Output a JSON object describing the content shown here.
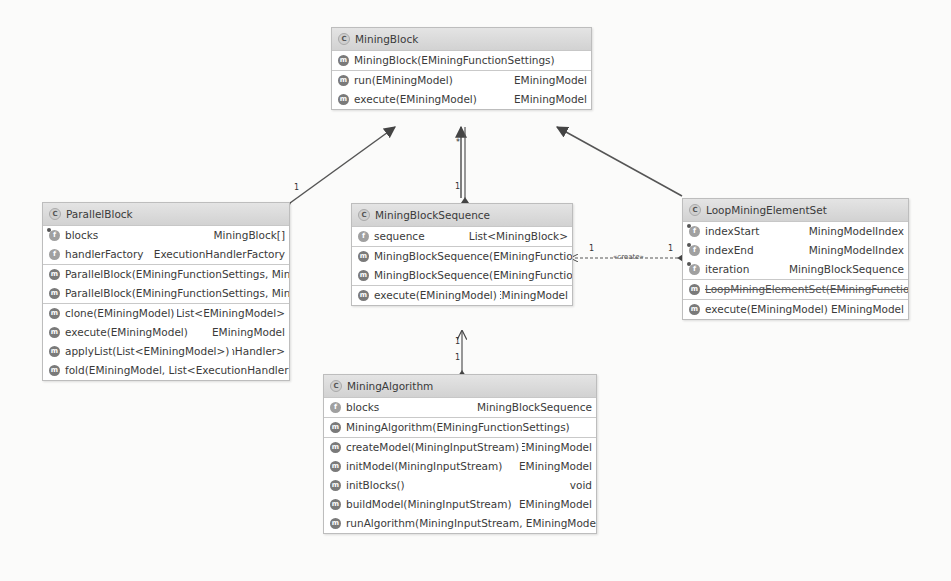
{
  "classes": {
    "mining_block": {
      "name": "MiningBlock",
      "icon": "class-icon",
      "constructors": [
        {
          "name": "MiningBlock(EMiningFunctionSettings)",
          "type": ""
        }
      ],
      "methods": [
        {
          "name": "run(EMiningModel)",
          "type": "EMiningModel"
        },
        {
          "name": "execute(EMiningModel)",
          "type": "EMiningModel"
        }
      ]
    },
    "parallel_block": {
      "name": "ParallelBlock",
      "icon": "class-icon",
      "fields": [
        {
          "name": "blocks",
          "type": "MiningBlock[]"
        },
        {
          "name": "handlerFactory",
          "type": "ExecutionHandlerFactory"
        }
      ],
      "constructors": [
        {
          "name": "ParallelBlock(EMiningFunctionSettings, MiningBl",
          "type": ""
        },
        {
          "name": "ParallelBlock(EMiningFunctionSettings, MiningBl",
          "type": ""
        }
      ],
      "methods": [
        {
          "name": "clone(EMiningModel)",
          "type": "List<EMiningModel>"
        },
        {
          "name": "execute(EMiningModel)",
          "type": "EMiningModel"
        },
        {
          "name": "applyList(List<EMiningModel>)",
          "type": "tionHandler>"
        },
        {
          "name": "fold(EMiningModel, List<ExecutionHandler>)",
          "type": ""
        }
      ]
    },
    "mining_block_sequence": {
      "name": "MiningBlockSequence",
      "icon": "class-icon",
      "fields": [
        {
          "name": "sequence",
          "type": "List<MiningBlock>"
        }
      ],
      "constructors": [
        {
          "name": "MiningBlockSequence(EMiningFunctionSet",
          "type": ""
        },
        {
          "name": "MiningBlockSequence(EMiningFunctionSet",
          "type": ""
        }
      ],
      "methods": [
        {
          "name": "execute(EMiningModel)",
          "type": "EMiningModel"
        }
      ]
    },
    "loop_mining_element_set": {
      "name": "LoopMiningElementSet",
      "icon": "class-icon",
      "fields": [
        {
          "name": "indexStart",
          "type": "MiningModelIndex"
        },
        {
          "name": "indexEnd",
          "type": "MiningModelIndex"
        },
        {
          "name": "iteration",
          "type": "MiningBlockSequence"
        }
      ],
      "constructors": [
        {
          "name": "LoopMiningElementSet(EMiningFunctionS",
          "type": ""
        }
      ],
      "methods": [
        {
          "name": "execute(EMiningModel)",
          "type": "EMiningModel"
        }
      ]
    },
    "mining_algorithm": {
      "name": "MiningAlgorithm",
      "icon": "class-icon",
      "fields": [
        {
          "name": "blocks",
          "type": "MiningBlockSequence"
        }
      ],
      "constructors": [
        {
          "name": "MiningAlgorithm(EMiningFunctionSettings)",
          "type": ""
        }
      ],
      "methods": [
        {
          "name": "createModel(MiningInputStream)",
          "type": "EMiningModel"
        },
        {
          "name": "initModel(MiningInputStream)",
          "type": "EMiningModel"
        },
        {
          "name": "initBlocks()",
          "type": "void"
        },
        {
          "name": "buildModel(MiningInputStream)",
          "type": "EMiningModel"
        },
        {
          "name": "runAlgorithm(MiningInputStream, EMiningModel) I",
          "type": ""
        }
      ]
    }
  },
  "relations": {
    "parallel_to_block_mult": "1",
    "sequence_to_block_mult_top": "*",
    "sequence_to_block_mult_bottom": "1",
    "create_label": "«create»",
    "create_mult_left": "1",
    "create_mult_right": "1",
    "algo_seq_mult_top": "1",
    "algo_seq_mult_bottom": "1"
  },
  "colors": {
    "header_bg": "#d8d8d8",
    "border": "#bdbdbd",
    "edge": "#555555"
  }
}
